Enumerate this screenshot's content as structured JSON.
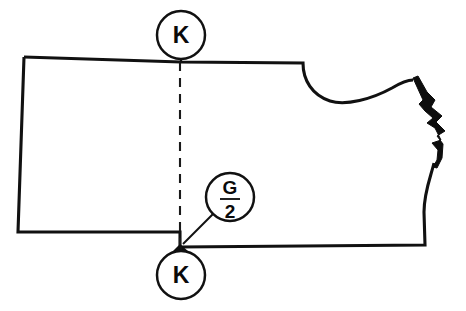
{
  "diagram": {
    "kind": "sewing-pattern-piece",
    "background_color": "#ffffff",
    "line_color": "#111111",
    "canvas": {
      "width": 466,
      "height": 311
    },
    "callouts": {
      "top_marker": {
        "label": "K",
        "icon_name": "balloon-callout-circle",
        "center_x": 181,
        "center_y": 35,
        "radius": 24
      },
      "bottom_marker": {
        "label": "K",
        "icon_name": "balloon-callout-circle",
        "center_x": 181,
        "center_y": 275,
        "radius": 24
      },
      "dimension_marker": {
        "numerator": "G",
        "denominator": "2",
        "icon_name": "balloon-callout-circle",
        "center_x": 230,
        "center_y": 197,
        "radius": 24
      }
    },
    "fold_line": {
      "name": "center-fold-dashed-line",
      "x": 180,
      "y_start": 62,
      "y_end": 245
    },
    "outline": {
      "name": "pattern-piece-outline",
      "path": "M 24,57 L 181,62 L 303,63 C 303,80 312,95 330,101 C 346,106 372,99 392,88 C 402,82 408,80 413,80"
    },
    "outline_lower": {
      "name": "pattern-piece-outline-lower",
      "path": "M 434,163 C 431,176 424,192 424,212 L 425,245 L 180,247 L 180,232 L 165,232 L 18,232 L 24,57"
    },
    "notched_edge": {
      "name": "notched-seam-edge",
      "path": "M 413,78 L 423,100 L 419,104 L 425,111 L 433,118 L 427,123 L 435,128 L 441,140 L 432,143 L 438,150 L 437,160 L 433,167 L 437,168 L 442,158 L 443,144 L 437,136 L 445,131 L 436,122 L 442,116 L 431,107 L 435,100 L 427,92 L 418,76 Z"
    },
    "arrow": {
      "name": "dimension-arrowhead",
      "tip_x": 180,
      "tip_y": 247
    },
    "leader": {
      "name": "dimension-leader-line",
      "from_x": 213,
      "from_y": 214,
      "to_x": 182,
      "to_y": 245
    }
  }
}
